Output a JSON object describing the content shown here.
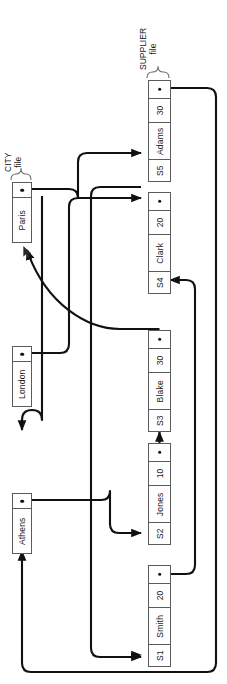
{
  "figure": {
    "title_city": "CITY\nfile",
    "city_label_line1": "CITY",
    "city_label_line2": "file",
    "supplier_label_line1": "SUPPLIER",
    "supplier_label_line2": "file",
    "ink_color": "#1a1a1a",
    "box_border_color": "#5b5b5b",
    "background": "#ffffff"
  },
  "city_file": {
    "name": "CITY file",
    "records": [
      {
        "id": "paris",
        "city": "Paris",
        "pointer": "pointer-dot"
      },
      {
        "id": "london",
        "city": "London",
        "pointer": "pointer-dot"
      },
      {
        "id": "athens",
        "city": "Athens",
        "pointer": "pointer-dot"
      }
    ]
  },
  "supplier_file": {
    "name": "SUPPLIER file",
    "columns": [
      "S#",
      "SNAME",
      "STATUS",
      "PTR"
    ],
    "records": [
      {
        "id": "S5",
        "snum": "S5",
        "sname": "Adams",
        "status": "30",
        "pointer": "pointer-dot"
      },
      {
        "id": "S4",
        "snum": "S4",
        "sname": "Clark",
        "status": "20",
        "pointer": "pointer-dot"
      },
      {
        "id": "S3",
        "snum": "S3",
        "sname": "Blake",
        "status": "30",
        "pointer": "pointer-dot"
      },
      {
        "id": "S2",
        "snum": "S2",
        "sname": "Jones",
        "status": "10",
        "pointer": "pointer-dot"
      },
      {
        "id": "S1",
        "snum": "S1",
        "sname": "Smith",
        "status": "20",
        "pointer": "pointer-dot"
      }
    ]
  },
  "links": [
    {
      "from": "paris-pointer",
      "to": "S5",
      "kind": "arrow"
    },
    {
      "from": "S5-pointer",
      "to": "athens",
      "kind": "arrow"
    },
    {
      "from": "london-pointer",
      "to": "S3",
      "kind": "arrow"
    },
    {
      "from": "S3-pointer",
      "to": "paris",
      "kind": "arrow"
    },
    {
      "from": "athens-pointer",
      "to": "S2",
      "kind": "arrow"
    },
    {
      "from": "S2-pointer",
      "to": "S3",
      "kind": "arrow"
    },
    {
      "from": "S4-pointer",
      "to": "S5",
      "kind": "arrow"
    },
    {
      "from": "S1-pointer",
      "to": "S4",
      "kind": "arrow"
    },
    {
      "from": "athens-chain",
      "to": "S1",
      "kind": "arrow"
    },
    {
      "from": "london-chain",
      "to": "london",
      "kind": "arrow"
    }
  ]
}
